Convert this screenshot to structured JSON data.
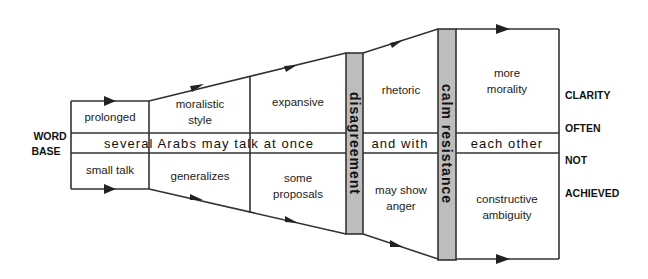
{
  "diagram": {
    "left_label": [
      "WORD",
      "BASE"
    ],
    "right_labels": [
      "CLARITY",
      "OFTEN",
      "NOT",
      "ACHIEVED"
    ],
    "stage1": {
      "top": "prolonged",
      "bottom": "small talk"
    },
    "stage2": {
      "top": [
        "moralistic",
        "style"
      ],
      "bottom": "generalizes"
    },
    "stage3": {
      "top": "expansive",
      "bottom": [
        "some",
        "proposals"
      ]
    },
    "barrier1": "disagreement",
    "stage4": {
      "top": "rhetoric",
      "bottom": [
        "may show",
        "anger"
      ]
    },
    "barrier2": "calm resistance",
    "stage5": {
      "top": [
        "more",
        "morality"
      ],
      "bottom": [
        "constructive",
        "ambiguity"
      ]
    },
    "middle_band": {
      "segment1": "several Arabs may talk at once",
      "segment2": "and with",
      "segment3": "each other"
    },
    "colors": {
      "line": "#333333",
      "barrier_fill": "#bdbdbd",
      "background": "#ffffff"
    }
  }
}
